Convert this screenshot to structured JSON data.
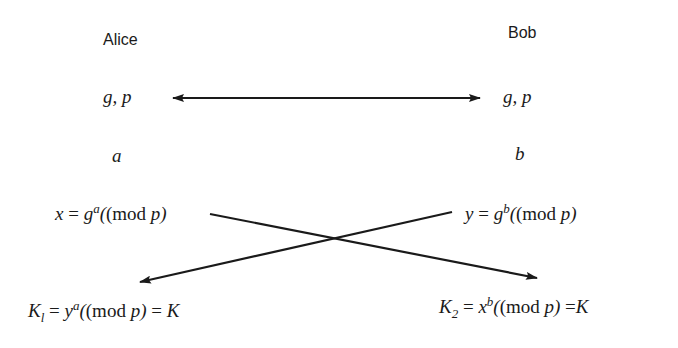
{
  "diagram": {
    "alice": {
      "name": "Alice",
      "public_params": "g, p",
      "secret": "a",
      "sent": {
        "lhs": "x",
        "eq": " = ",
        "base": "g",
        "exp": "a",
        "mod": "(mod ",
        "p": "p",
        "close": ")"
      },
      "key": {
        "k": "K",
        "sub": "l",
        "eq": " = ",
        "base": "y",
        "exp": "a",
        "mod": "(mod ",
        "p": "p",
        "close": ")",
        "tail": " = ",
        "result": "K"
      }
    },
    "bob": {
      "name": "Bob",
      "public_params": "g, p",
      "secret": "b",
      "sent": {
        "lhs": "y",
        "eq": " = ",
        "base": "g",
        "exp": "b",
        "mod": "(mod ",
        "p": "p",
        "close": ")"
      },
      "key": {
        "k": "K",
        "sub": "2",
        "eq": " = ",
        "base": "x",
        "exp": "b",
        "mod": "(mod ",
        "p": "p",
        "close": ")",
        "tail": " =",
        "result": "K"
      }
    },
    "arrows": [
      {
        "id": "public-exchange",
        "from": [
          173,
          98
        ],
        "to": [
          480,
          98
        ],
        "double": true
      },
      {
        "id": "x-to-bob",
        "from": [
          210,
          214
        ],
        "to": [
          537,
          278
        ]
      },
      {
        "id": "y-to-alice",
        "from": [
          452,
          212
        ],
        "to": [
          140,
          282
        ]
      }
    ],
    "line_color": "#1a1a1a"
  }
}
